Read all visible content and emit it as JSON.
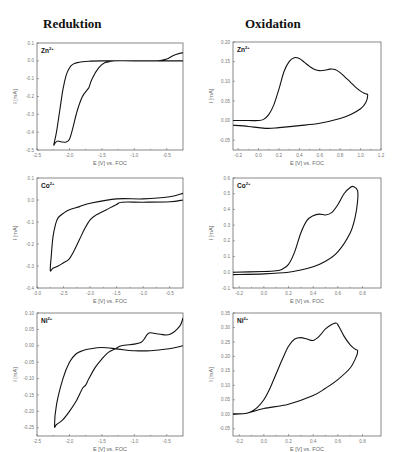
{
  "titles": {
    "left": "Reduktion",
    "right": "Oxidation"
  },
  "chart_data": [
    {
      "id": "red-zn",
      "type": "line",
      "title": "Zn",
      "title_sup": "2+",
      "xlabel": "E [V] vs. FOC",
      "ylabel": "I [mA]",
      "xlim": [
        -2.5,
        -0.25
      ],
      "ylim": [
        -0.5,
        0.1
      ],
      "x_reversed_ticks": true,
      "xticks": [
        -2.5,
        -2.0,
        -1.5,
        -1.0,
        -0.5
      ],
      "xtick_labels": [
        "-2.5",
        "-2.0",
        "-1.5",
        "-1.0",
        "-0.5"
      ],
      "yticks": [
        0.1,
        0.0,
        -0.1,
        -0.2,
        -0.3,
        -0.4,
        -0.5
      ],
      "ytick_labels": [
        "0.1",
        "0.0",
        "-0.1",
        "-0.2",
        "-0.3",
        "-0.4",
        "-0.5"
      ],
      "box": [
        37,
        43,
        183,
        150
      ],
      "series": [
        {
          "name": "CV",
          "x": [
            -0.25,
            -0.5,
            -1.0,
            -1.5,
            -1.7,
            -1.8,
            -1.88,
            -1.95,
            -2.0,
            -2.05,
            -2.1,
            -2.15,
            -2.2,
            -2.24,
            -2.22,
            -2.18,
            -2.12,
            -2.05,
            -2.0,
            -1.95,
            -1.88,
            -1.8,
            -1.72,
            -1.7,
            -1.65,
            -1.55,
            -1.45,
            -1.3,
            -1.0,
            -0.75,
            -0.6,
            -0.5,
            -0.4,
            -0.3,
            -0.25
          ],
          "y": [
            0.0,
            0.0,
            0.0,
            0.0,
            -0.002,
            -0.005,
            -0.01,
            -0.02,
            -0.04,
            -0.08,
            -0.16,
            -0.28,
            -0.4,
            -0.47,
            -0.46,
            -0.45,
            -0.455,
            -0.455,
            -0.44,
            -0.38,
            -0.28,
            -0.2,
            -0.16,
            -0.15,
            -0.1,
            -0.04,
            -0.01,
            0.0,
            0.0,
            0.0,
            0.002,
            0.01,
            0.03,
            0.042,
            0.045
          ]
        }
      ]
    },
    {
      "id": "ox-zn",
      "type": "line",
      "title": "Zn",
      "title_sup": "2+",
      "xlabel": "E [V] vs. FOC",
      "ylabel": "I [mA]",
      "xlim": [
        -0.25,
        1.2
      ],
      "ylim": [
        -0.075,
        0.2
      ],
      "xticks": [
        -0.2,
        0.0,
        0.2,
        0.4,
        0.6,
        0.8,
        1.0,
        1.2
      ],
      "xtick_labels": [
        "-0.2",
        "0.0",
        "0.2",
        "0.4",
        "0.6",
        "0.8",
        "1.0",
        "1.2"
      ],
      "yticks": [
        0.2,
        0.15,
        0.1,
        0.05,
        0.0,
        -0.05
      ],
      "ytick_labels": [
        "0.20",
        "0.15",
        "0.10",
        "0.05",
        "0.00",
        "-0.05"
      ],
      "box": [
        233,
        42,
        381,
        150
      ],
      "series": [
        {
          "name": "CV",
          "x": [
            -0.25,
            -0.1,
            0.0,
            0.05,
            0.1,
            0.15,
            0.2,
            0.25,
            0.3,
            0.35,
            0.4,
            0.45,
            0.5,
            0.55,
            0.6,
            0.65,
            0.7,
            0.75,
            0.8,
            0.85,
            0.9,
            0.95,
            1.0,
            1.05,
            1.07,
            1.05,
            1.0,
            0.9,
            0.8,
            0.6,
            0.4,
            0.2,
            0.1,
            0.0,
            -0.1,
            -0.25
          ],
          "y": [
            0.0,
            0.0,
            0.0,
            0.003,
            0.015,
            0.04,
            0.08,
            0.125,
            0.15,
            0.16,
            0.158,
            0.148,
            0.138,
            0.13,
            0.127,
            0.128,
            0.131,
            0.13,
            0.122,
            0.11,
            0.098,
            0.085,
            0.075,
            0.068,
            0.065,
            0.045,
            0.03,
            0.015,
            0.005,
            -0.007,
            -0.013,
            -0.018,
            -0.02,
            -0.018,
            -0.015,
            -0.012
          ]
        }
      ]
    },
    {
      "id": "red-co",
      "type": "line",
      "title": "Co",
      "title_sup": "2+",
      "xlabel": "E [V] vs. FOC",
      "ylabel": "I [mA]",
      "xlim": [
        -3.0,
        -0.25
      ],
      "ylim": [
        -0.4,
        0.1
      ],
      "xticks": [
        -3.0,
        -2.5,
        -2.0,
        -1.5,
        -1.0,
        -0.5
      ],
      "xtick_labels": [
        "-3.0",
        "-2.5",
        "-2.0",
        "-1.5",
        "-1.0",
        "-0.5"
      ],
      "yticks": [
        0.1,
        0.0,
        -0.1,
        -0.2,
        -0.3,
        -0.4
      ],
      "ytick_labels": [
        "0.1",
        "0.0",
        "-0.1",
        "-0.2",
        "-0.3",
        "-0.4"
      ],
      "box": [
        37,
        178,
        183,
        288
      ],
      "series": [
        {
          "name": "CV",
          "x": [
            -0.25,
            -0.5,
            -1.0,
            -1.4,
            -1.5,
            -1.7,
            -1.9,
            -2.0,
            -2.1,
            -2.2,
            -2.3,
            -2.4,
            -2.5,
            -2.6,
            -2.7,
            -2.75,
            -2.73,
            -2.7,
            -2.65,
            -2.6,
            -2.5,
            -2.4,
            -2.2,
            -2.0,
            -1.5,
            -1.0,
            -0.5,
            -0.25
          ],
          "y": [
            0.0,
            -0.008,
            -0.01,
            -0.01,
            -0.02,
            -0.045,
            -0.07,
            -0.09,
            -0.13,
            -0.18,
            -0.23,
            -0.27,
            -0.285,
            -0.3,
            -0.31,
            -0.32,
            -0.25,
            -0.17,
            -0.11,
            -0.08,
            -0.06,
            -0.045,
            -0.03,
            -0.015,
            0.005,
            0.005,
            0.015,
            0.03
          ]
        }
      ]
    },
    {
      "id": "ox-co",
      "type": "line",
      "title": "Co",
      "title_sup": "2+",
      "xlabel": "E [V] vs. FOC",
      "ylabel": "I [mA]",
      "xlim": [
        -0.25,
        0.95
      ],
      "ylim": [
        -0.1,
        0.6
      ],
      "xticks": [
        -0.2,
        0.0,
        0.2,
        0.4,
        0.6,
        0.8
      ],
      "xtick_labels": [
        "-0.2",
        "0.0",
        "0.2",
        "0.4",
        "0.6",
        "0.8"
      ],
      "yticks": [
        0.6,
        0.5,
        0.4,
        0.3,
        0.2,
        0.1,
        0.0,
        -0.1
      ],
      "ytick_labels": [
        "0.6",
        "0.5",
        "0.4",
        "0.3",
        "0.2",
        "0.1",
        "0.0",
        "-0.1"
      ],
      "box": [
        233,
        178,
        381,
        288
      ],
      "series": [
        {
          "name": "CV",
          "x": [
            -0.25,
            0.0,
            0.1,
            0.15,
            0.2,
            0.25,
            0.3,
            0.35,
            0.4,
            0.45,
            0.5,
            0.55,
            0.6,
            0.65,
            0.7,
            0.73,
            0.76,
            0.76,
            0.74,
            0.7,
            0.6,
            0.5,
            0.4,
            0.3,
            0.2,
            0.0,
            -0.25
          ],
          "y": [
            0.0,
            0.005,
            0.01,
            0.02,
            0.05,
            0.13,
            0.25,
            0.33,
            0.36,
            0.37,
            0.365,
            0.38,
            0.43,
            0.5,
            0.54,
            0.545,
            0.52,
            0.45,
            0.35,
            0.25,
            0.13,
            0.07,
            0.035,
            0.015,
            0.0,
            -0.01,
            -0.015
          ]
        }
      ]
    },
    {
      "id": "red-ni",
      "type": "line",
      "title": "Ni",
      "title_sup": "2+",
      "xlabel": "E [V] vs. FOC",
      "ylabel": "I [mA]",
      "xlim": [
        -2.5,
        -0.25
      ],
      "ylim": [
        -0.275,
        0.1
      ],
      "xticks": [
        -2.5,
        -2.0,
        -1.5,
        -1.0,
        -0.5
      ],
      "xtick_labels": [
        "-2.5",
        "-2.0",
        "-1.5",
        "-1.0",
        "-0.5"
      ],
      "yticks": [
        0.1,
        0.05,
        0.0,
        -0.05,
        -0.1,
        -0.15,
        -0.2,
        -0.25
      ],
      "ytick_labels": [
        "0.10",
        "0.05",
        "0.00",
        "-0.05",
        "-0.10",
        "-0.15",
        "-0.20",
        "-0.25"
      ],
      "box": [
        37,
        313,
        183,
        436
      ],
      "series": [
        {
          "name": "CV",
          "x": [
            -0.25,
            -0.5,
            -0.75,
            -1.0,
            -1.25,
            -1.5,
            -1.7,
            -1.8,
            -1.9,
            -2.0,
            -2.1,
            -2.2,
            -2.23,
            -2.2,
            -2.1,
            -2.0,
            -1.9,
            -1.8,
            -1.75,
            -1.7,
            -1.6,
            -1.5,
            -1.4,
            -1.3,
            -1.2,
            -1.0,
            -0.9,
            -0.85,
            -0.8,
            -0.75,
            -0.6,
            -0.45,
            -0.3,
            -0.25
          ],
          "y": [
            0.0,
            -0.01,
            -0.015,
            -0.015,
            -0.01,
            -0.005,
            -0.01,
            -0.015,
            -0.025,
            -0.05,
            -0.1,
            -0.18,
            -0.245,
            -0.24,
            -0.225,
            -0.2,
            -0.17,
            -0.13,
            -0.12,
            -0.1,
            -0.065,
            -0.04,
            -0.02,
            -0.01,
            0.0,
            0.005,
            0.01,
            0.02,
            0.035,
            0.04,
            0.035,
            0.035,
            0.06,
            0.085
          ]
        }
      ]
    },
    {
      "id": "ox-ni",
      "type": "line",
      "title": "Ni",
      "title_sup": "2+",
      "xlabel": "E [V] vs. FOC",
      "ylabel": "I [mA]",
      "xlim": [
        -0.25,
        0.95
      ],
      "ylim": [
        -0.075,
        0.35
      ],
      "xticks": [
        -0.2,
        0.0,
        0.2,
        0.4,
        0.6,
        0.8
      ],
      "xtick_labels": [
        "-0.2",
        "0.0",
        "0.2",
        "0.4",
        "0.6",
        "0.8"
      ],
      "yticks": [
        0.35,
        0.3,
        0.25,
        0.2,
        0.15,
        0.1,
        0.05,
        0.0,
        -0.05
      ],
      "ytick_labels": [
        "0.35",
        "0.30",
        "0.25",
        "0.20",
        "0.15",
        "0.10",
        "0.05",
        "0.00",
        "-0.05"
      ],
      "box": [
        233,
        313,
        381,
        436
      ],
      "series": [
        {
          "name": "CV",
          "x": [
            -0.25,
            -0.15,
            -0.1,
            -0.05,
            0.0,
            0.05,
            0.1,
            0.15,
            0.2,
            0.25,
            0.3,
            0.35,
            0.4,
            0.45,
            0.5,
            0.55,
            0.58,
            0.6,
            0.65,
            0.7,
            0.74,
            0.76,
            0.75,
            0.7,
            0.6,
            0.5,
            0.4,
            0.2,
            0.0,
            -0.15,
            -0.25
          ],
          "y": [
            0.0,
            0.003,
            0.01,
            0.025,
            0.05,
            0.09,
            0.14,
            0.19,
            0.235,
            0.26,
            0.265,
            0.26,
            0.255,
            0.27,
            0.295,
            0.31,
            0.315,
            0.31,
            0.27,
            0.24,
            0.225,
            0.22,
            0.2,
            0.16,
            0.12,
            0.09,
            0.065,
            0.035,
            0.02,
            0.003,
            0.002
          ]
        }
      ]
    }
  ]
}
